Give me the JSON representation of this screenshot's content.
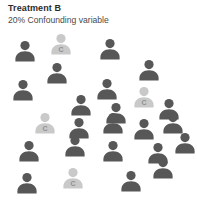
{
  "header": {
    "title": "Treatment B",
    "subtitle": "20% Confounding variable"
  },
  "colors": {
    "background": "#ffffff",
    "title_text": "#2b2b2b",
    "subtitle_text": "#4a4a4a",
    "person_dark": "#575757",
    "person_light": "#c9c9c9",
    "badge_letter": "#8f8f8f"
  },
  "legend": {
    "confounded_marker_label": "C"
  },
  "chart_data": {
    "type": "pictogram",
    "title": "Treatment B",
    "subtitle": "20% Confounding variable",
    "unit": "person icon",
    "total_icons": 25,
    "categories": [
      "Standard",
      "Confounding variable"
    ],
    "values": [
      21,
      4
    ],
    "percentages": [
      80,
      20
    ],
    "category_colors": [
      "#575757",
      "#c9c9c9"
    ],
    "confounded_marker": "C",
    "grid": "scattered",
    "icons": [
      {
        "x": 12,
        "y": 38,
        "type": "standard",
        "label": ""
      },
      {
        "x": 48,
        "y": 31,
        "type": "confounded",
        "label": "C"
      },
      {
        "x": 97,
        "y": 36,
        "type": "standard",
        "label": ""
      },
      {
        "x": 136,
        "y": 57,
        "type": "standard",
        "label": ""
      },
      {
        "x": 44,
        "y": 60,
        "type": "standard",
        "label": ""
      },
      {
        "x": 10,
        "y": 77,
        "type": "standard",
        "label": ""
      },
      {
        "x": 94,
        "y": 76,
        "type": "standard",
        "label": ""
      },
      {
        "x": 131,
        "y": 84,
        "type": "confounded",
        "label": "C"
      },
      {
        "x": 68,
        "y": 92,
        "type": "standard",
        "label": ""
      },
      {
        "x": 103,
        "y": 100,
        "type": "standard",
        "label": ""
      },
      {
        "x": 156,
        "y": 96,
        "type": "standard",
        "label": ""
      },
      {
        "x": 32,
        "y": 110,
        "type": "confounded",
        "label": "C"
      },
      {
        "x": 66,
        "y": 115,
        "type": "standard",
        "label": ""
      },
      {
        "x": 100,
        "y": 110,
        "type": "standard",
        "label": ""
      },
      {
        "x": 131,
        "y": 116,
        "type": "standard",
        "label": ""
      },
      {
        "x": 160,
        "y": 110,
        "type": "standard",
        "label": ""
      },
      {
        "x": 16,
        "y": 138,
        "type": "standard",
        "label": ""
      },
      {
        "x": 62,
        "y": 133,
        "type": "standard",
        "label": ""
      },
      {
        "x": 100,
        "y": 138,
        "type": "standard",
        "label": ""
      },
      {
        "x": 145,
        "y": 140,
        "type": "standard",
        "label": ""
      },
      {
        "x": 172,
        "y": 130,
        "type": "standard",
        "label": ""
      },
      {
        "x": 14,
        "y": 170,
        "type": "standard",
        "label": ""
      },
      {
        "x": 60,
        "y": 165,
        "type": "confounded",
        "label": "C"
      },
      {
        "x": 118,
        "y": 168,
        "type": "standard",
        "label": ""
      },
      {
        "x": 150,
        "y": 155,
        "type": "standard",
        "label": ""
      }
    ]
  }
}
